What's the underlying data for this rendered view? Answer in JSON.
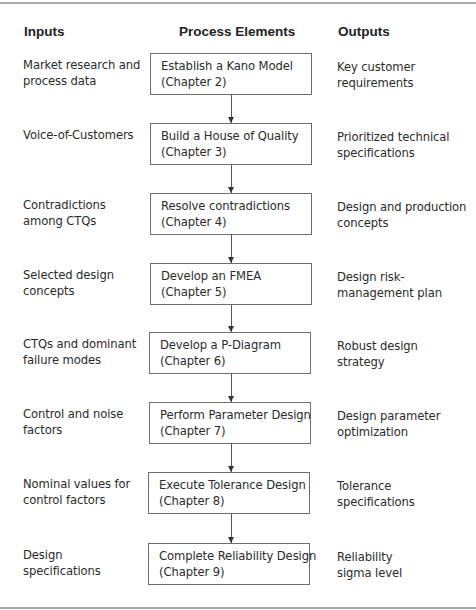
{
  "headers": {
    "inputs": "Inputs",
    "process": "Process Elements",
    "outputs": "Outputs"
  },
  "rows": [
    {
      "input": [
        "Market research and",
        "process data"
      ],
      "process": [
        "Establish a Kano Model",
        "(Chapter 2)"
      ],
      "output": [
        "Key customer",
        "requirements"
      ]
    },
    {
      "input": [
        "Voice-of-Customers"
      ],
      "process": [
        "Build a House of Quality",
        "(Chapter 3)"
      ],
      "output": [
        "Prioritized technical",
        "specifications"
      ]
    },
    {
      "input": [
        "Contradictions",
        "among CTQs"
      ],
      "process": [
        "Resolve contradictions",
        "(Chapter 4)"
      ],
      "output": [
        "Design and production",
        "concepts"
      ]
    },
    {
      "input": [
        "Selected design",
        "concepts"
      ],
      "process": [
        "Develop an FMEA",
        "(Chapter 5)"
      ],
      "output": [
        "Design risk-",
        "management plan"
      ]
    },
    {
      "input": [
        "CTQs and dominant",
        "failure modes"
      ],
      "process": [
        "Develop a P-Diagram",
        "(Chapter 6)"
      ],
      "output": [
        "Robust design",
        "strategy"
      ]
    },
    {
      "input": [
        "Control and noise",
        "factors"
      ],
      "process": [
        "Perform Parameter Design",
        "(Chapter 7)"
      ],
      "output": [
        "Design parameter",
        "optimization"
      ]
    },
    {
      "input": [
        "Nominal values for",
        "control factors"
      ],
      "process": [
        "Execute Tolerance Design",
        "(Chapter 8)"
      ],
      "output": [
        "Tolerance",
        "specifications"
      ]
    },
    {
      "input": [
        "Design",
        "specifications"
      ],
      "process": [
        "Complete Reliability Design",
        "(Chapter 9)"
      ],
      "output": [
        "Reliability",
        "sigma level"
      ]
    }
  ]
}
